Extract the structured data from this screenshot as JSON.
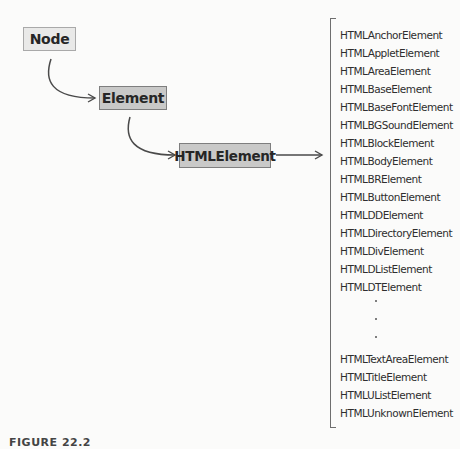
{
  "diagram": {
    "nodes": {
      "node": {
        "label": "Node"
      },
      "element": {
        "label": "Element"
      },
      "htmlelement": {
        "label": "HTMLElement"
      }
    },
    "subclasses_top": [
      "HTMLAnchorElement",
      "HTMLAppletElement",
      "HTMLAreaElement",
      "HTMLBaseElement",
      "HTMLBaseFontElement",
      "HTMLBGSoundElement",
      "HTMLBlockElement",
      "HTMLBodyElement",
      "HTMLBRElement",
      "HTMLButtonElement",
      "HTMLDDElement",
      "HTMLDirectoryElement",
      "HTMLDivElement",
      "HTMLDListElement",
      "HTMLDTElement"
    ],
    "ellipsis": [
      ".",
      ".",
      "."
    ],
    "subclasses_bottom": [
      "HTMLTextAreaElement",
      "HTMLTitleElement",
      "HTMLUListElement",
      "HTMLUnknownElement"
    ],
    "caption": "FIGURE 22.2"
  },
  "colors": {
    "background": "#fbfbfa",
    "node_fill": "#e9e9e8",
    "element_fill": "#c9c9c8",
    "stroke": "#555555"
  }
}
